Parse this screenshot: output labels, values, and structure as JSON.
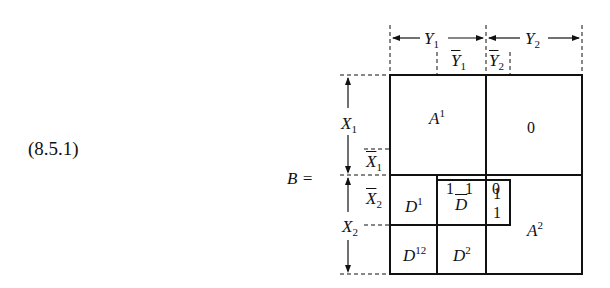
{
  "equation_number": "(8.5.1)",
  "matrix_label": "B =",
  "column_labels": {
    "Y1": {
      "base": "Y",
      "sub": "1"
    },
    "Y2": {
      "base": "Y",
      "sub": "2"
    },
    "Y1bar": {
      "base": "Y",
      "sub": "1"
    },
    "Y2bar": {
      "base": "Y",
      "sub": "2"
    }
  },
  "row_labels": {
    "X1": {
      "base": "X",
      "sub": "1"
    },
    "X2": {
      "base": "X",
      "sub": "2"
    },
    "X1bar": {
      "base": "X",
      "sub": "1"
    },
    "X2bar": {
      "base": "X",
      "sub": "2"
    }
  },
  "blocks": {
    "A1": {
      "base": "A",
      "sup": "1"
    },
    "zero_block": "0",
    "D1": {
      "base": "D",
      "sup": "1"
    },
    "Dbar": {
      "base": "D"
    },
    "A2": {
      "base": "A",
      "sup": "2"
    },
    "D12": {
      "base": "D",
      "sup": "12"
    },
    "D2": {
      "base": "D",
      "sup": "2"
    }
  },
  "inner_entries": {
    "row_top": [
      "1",
      "1",
      "0"
    ],
    "col_right": [
      "1",
      "1"
    ]
  }
}
